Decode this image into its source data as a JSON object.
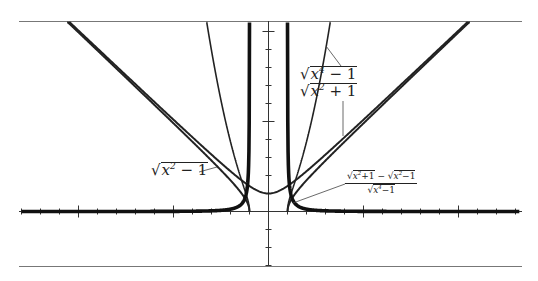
{
  "chart_data": {
    "type": "line",
    "title": "",
    "xlabel": "",
    "ylabel": "",
    "xlim": [
      -13,
      13.5
    ],
    "ylim": [
      -3,
      10.5
    ],
    "grid": false,
    "x_tick_step": 1,
    "x_major_tick_step": 5,
    "y_tick_step": 1,
    "y_major_tick_step": 5,
    "series": [
      {
        "name": "sqrt(x^2 - 1)",
        "label": "√(x² − 1)",
        "domain": "|x| ≥ 1",
        "style": "thin"
      },
      {
        "name": "sqrt(x^2 + 1)",
        "label": "√(x² + 1)",
        "domain": "all x",
        "style": "thin"
      },
      {
        "name": "sqrt(x^4 - 1)",
        "label": "√(x⁴ − 1)",
        "domain": "|x| ≥ 1",
        "style": "thin"
      },
      {
        "name": "(sqrt(x^2+1) - sqrt(x^2-1)) / sqrt(x^4-1)",
        "label": "(√(x²+1) − √(x²−1)) / √(x⁴−1)",
        "domain": "|x| > 1",
        "style": "thick",
        "asymptotes_x": [
          -1,
          1
        ],
        "asymptote_y": 0
      }
    ],
    "sample_points": {
      "sqrt(x^2 + 1)": [
        [
          0,
          1
        ],
        [
          1,
          1.41
        ],
        [
          3,
          3.16
        ],
        [
          5,
          5.1
        ],
        [
          10,
          10.05
        ]
      ],
      "sqrt(x^2 - 1)": [
        [
          1,
          0
        ],
        [
          2,
          1.73
        ],
        [
          3,
          2.83
        ],
        [
          5,
          4.9
        ],
        [
          10,
          9.95
        ]
      ],
      "sqrt(x^4 - 1)": [
        [
          1,
          0
        ],
        [
          1.5,
          2.02
        ],
        [
          2,
          3.87
        ],
        [
          3,
          8.94
        ]
      ],
      "(sqrt(x^2+1) - sqrt(x^2-1)) / sqrt(x^4-1)": [
        [
          1.05,
          2.2
        ],
        [
          1.2,
          0.55
        ],
        [
          1.5,
          0.24
        ],
        [
          2,
          0.1
        ],
        [
          3,
          0.04
        ],
        [
          5,
          0.01
        ]
      ]
    }
  },
  "labels": {
    "sqrt_x4_minus_1": {
      "base": "x",
      "exp": "4",
      "rest": " − 1"
    },
    "sqrt_x2_plus_1": {
      "base": "x",
      "exp": "2",
      "rest": " + 1"
    },
    "sqrt_x2_minus_1": {
      "base": "x",
      "exp": "2",
      "rest": " − 1"
    },
    "fraction": {
      "num_a_base": "x",
      "num_a_exp": "2",
      "num_a_rest": "+1",
      "minus": "−",
      "num_b_base": "x",
      "num_b_exp": "2",
      "num_b_rest": "−1",
      "den_base": "x",
      "den_exp": "4",
      "den_rest": "−1"
    },
    "radical": "√"
  }
}
